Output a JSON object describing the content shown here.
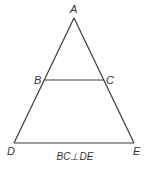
{
  "diagram": {
    "type": "geometry-figure",
    "points": {
      "A": {
        "label": "A",
        "x": 74,
        "y": 18
      },
      "B": {
        "label": "B",
        "x": 44,
        "y": 80
      },
      "C": {
        "label": "C",
        "x": 104,
        "y": 80
      },
      "D": {
        "label": "D",
        "x": 14,
        "y": 143
      },
      "E": {
        "label": "E",
        "x": 134,
        "y": 143
      }
    },
    "segments": [
      "AD",
      "AE",
      "BC",
      "DE"
    ],
    "caption": "BC⊥DE",
    "colors": {
      "line": "#3a3a3a",
      "text": "#333333",
      "background": "#ffffff"
    }
  }
}
